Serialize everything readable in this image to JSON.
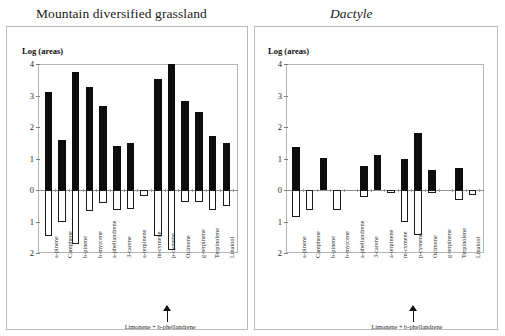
{
  "chart_data": [
    {
      "type": "bar",
      "title": "Mountain diversified grassland",
      "ylabel": "Log (areas)",
      "xlabel": "",
      "ylim": [
        -2,
        4
      ],
      "yticks": [
        4,
        3,
        2,
        1,
        0,
        1,
        2
      ],
      "ytick_values": [
        4,
        3,
        2,
        1,
        0,
        -1,
        -2
      ],
      "grid": false,
      "legend": "none",
      "categories": [
        "a-pinene",
        "Camphene",
        "b-pinene",
        "b-myrcene",
        "a-phellandrene",
        "3-carene",
        "a-terpinene",
        "m-cymene",
        "p-cymene",
        "Ocimene",
        "g-terpinene",
        "Terpinolene",
        "Linalool"
      ],
      "series": [
        {
          "name": "positive",
          "values": [
            3.1,
            1.58,
            3.75,
            3.27,
            2.68,
            1.4,
            1.48,
            0.0,
            3.52,
            4.0,
            2.84,
            2.48,
            1.7,
            1.5
          ]
        },
        {
          "name": "negative",
          "values": [
            -1.45,
            -1.0,
            -1.73,
            -0.68,
            -0.4,
            -0.64,
            -0.6,
            -0.18,
            -1.45,
            -1.9,
            -0.38,
            -0.38,
            -0.65,
            -0.5
          ]
        }
      ],
      "annotation": {
        "text": "Limonene + b-phellandrene",
        "points_to": "p-cymene"
      }
    },
    {
      "type": "bar",
      "title": "Dactyle",
      "ylabel": "Log (areas)",
      "xlabel": "",
      "ylim": [
        -2,
        4
      ],
      "yticks": [
        4,
        3,
        2,
        1,
        0,
        1,
        2
      ],
      "ytick_values": [
        4,
        3,
        2,
        1,
        0,
        -1,
        -2
      ],
      "grid": false,
      "legend": "none",
      "categories": [
        "a-pinene",
        "Camphene",
        "b-pinene",
        "b-myrcene",
        "a-phellandrene",
        "3-carene",
        "a-terpinene",
        "m-cymene",
        "p-cymene",
        "Ocimene",
        "g-terpinene",
        "Terpinolene",
        "Linalool"
      ],
      "series": [
        {
          "name": "positive",
          "values": [
            1.38,
            0.0,
            1.03,
            0.0,
            0.0,
            0.75,
            1.1,
            0.0,
            1.0,
            1.8,
            0.65,
            0.0,
            0.7,
            0.0
          ]
        },
        {
          "name": "negative",
          "values": [
            -0.85,
            -0.65,
            0.0,
            -0.65,
            0.0,
            -0.22,
            0.0,
            -0.1,
            -1.0,
            -1.42,
            -0.1,
            0.0,
            -0.32,
            -0.15
          ]
        }
      ],
      "annotation": {
        "text": "Limonene + b-phellandrene",
        "points_to": "p-cymene"
      }
    }
  ],
  "left": {
    "title": "Mountain diversified grassland",
    "ylabel": "Log (areas)",
    "yticks": [
      "4",
      "3",
      "2",
      "1",
      "0",
      "1",
      "2"
    ],
    "xlabels": [
      "a-pinene",
      "Camphene",
      "b-pinene",
      "b-myrcene",
      "a-phellandrene",
      "3-carene",
      "a-terpinene",
      "m-cymene",
      "p-cymene",
      "Ocimene",
      "g-terpinene",
      "Terpinolene",
      "Linalool"
    ],
    "annotation": "Limonene + b-phellandrene"
  },
  "right": {
    "title": "Dactyle",
    "ylabel": "Log (areas)",
    "yticks": [
      "4",
      "3",
      "2",
      "1",
      "0",
      "1",
      "2"
    ],
    "xlabels": [
      "a-pinene",
      "Camphene",
      "b-pinene",
      "b-myrcene",
      "a-phellandrene",
      "3-carene",
      "a-terpinene",
      "m-cymene",
      "p-cymene",
      "Ocimene",
      "g-terpinene",
      "Terpinolene",
      "Linalool"
    ],
    "annotation": "Limonene + b-phellandrene"
  },
  "colors": {
    "bar_positive": "#0d0d0d",
    "bar_negative": "#ffffff",
    "bar_negative_border": "#1a1a1a",
    "axis": "#b5b5b5",
    "text": "#1a1a1a",
    "background": "#ffffff"
  }
}
